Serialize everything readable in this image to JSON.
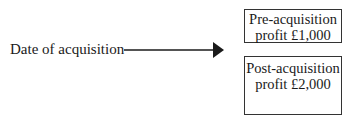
{
  "diagram": {
    "source_label": "Date of acquisition",
    "arrow": {
      "direction": "right",
      "color": "#1a1a1a"
    },
    "boxes": [
      {
        "line1": "Pre-acquisition",
        "line2": "profit £1,000"
      },
      {
        "line1": "Post-acquisition",
        "line2": "profit £2,000"
      }
    ]
  }
}
